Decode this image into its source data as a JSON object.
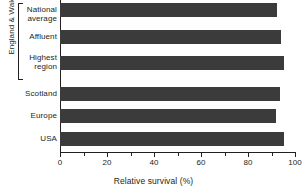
{
  "chart_data": {
    "type": "bar",
    "orientation": "horizontal",
    "title": "",
    "xlabel": "Relative survival (%)",
    "ylabel": "",
    "xlim": [
      0,
      100
    ],
    "xticks": [
      0,
      20,
      40,
      60,
      80,
      100
    ],
    "xtick_labels": [
      "0",
      "20",
      "40",
      "60",
      "80",
      "100"
    ],
    "minor_xticks": [
      10,
      30,
      50,
      70,
      90
    ],
    "grid": false,
    "legend": null,
    "bar_color": "#3b3b3b",
    "axis_color": "#231f20",
    "categories": [
      "National average",
      "Affluent",
      "Highest region",
      "Scotland",
      "Europe",
      "USA"
    ],
    "values": [
      92.5,
      94,
      95.5,
      93.5,
      92,
      95.5
    ],
    "groups": [
      {
        "label": "England & Wales",
        "categories": [
          "National average",
          "Affluent",
          "Highest region"
        ]
      }
    ]
  },
  "labels": {
    "group_bracket": "England & Wales",
    "cat_0_line1": "National",
    "cat_0_line2": "average",
    "cat_1_line1": "Affluent",
    "cat_2_line1": "Highest",
    "cat_2_line2": "region",
    "cat_3_line1": "Scotland",
    "cat_4_line1": "Europe",
    "cat_5_line1": "USA"
  },
  "axis": {
    "title": "Relative survival (%)",
    "tick_0": "0",
    "tick_1": "20",
    "tick_2": "40",
    "tick_3": "60",
    "tick_4": "80",
    "tick_5": "100"
  }
}
